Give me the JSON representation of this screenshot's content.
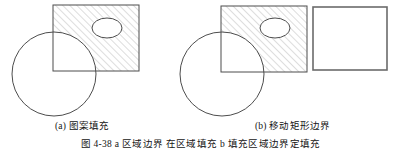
{
  "figure": {
    "panels": [
      {
        "id": "a",
        "caption": "(a) 图案填充",
        "shapes": {
          "circle": {
            "cx": 54,
            "cy": 74,
            "r": 42,
            "name": "circle-outline",
            "fill": "none"
          },
          "hatched_rect": {
            "x": 53,
            "y": 5,
            "width": 86,
            "height": 66,
            "name": "hatched-rectangle",
            "fill": "diagonal-hatch"
          },
          "ellipse": {
            "cx": 107,
            "cy": 28,
            "rx": 15,
            "ry": 10,
            "name": "ellipse-hole",
            "fill": "white"
          }
        }
      },
      {
        "id": "b",
        "caption": "(b) 移动矩形边界",
        "shapes": {
          "circle": {
            "cx": 222,
            "cy": 74,
            "r": 42,
            "name": "circle-outline",
            "fill": "none"
          },
          "hatched_rect": {
            "x": 221,
            "y": 6,
            "width": 86,
            "height": 66,
            "name": "hatched-rectangle",
            "fill": "diagonal-hatch"
          },
          "ellipse": {
            "cx": 275,
            "cy": 28,
            "rx": 15,
            "ry": 10,
            "name": "ellipse-hole",
            "fill": "white"
          },
          "moved_rect": {
            "x": 313,
            "y": 7,
            "width": 74,
            "height": 63,
            "name": "moved-boundary-rectangle",
            "fill": "white"
          }
        }
      }
    ],
    "figure_caption": "图 4-38  a 区域边界  在区域填充  b 填充区域边界定填充",
    "colors": {
      "stroke": "#4d4d4d",
      "hatch": "#b3b3b3",
      "moved_rect_stroke": "#6b6b6b",
      "text": "#141414",
      "background": "#ffffff"
    },
    "hatch": {
      "angle_degrees": 45,
      "spacing_px": 5,
      "line_width_px": 0.8
    }
  }
}
